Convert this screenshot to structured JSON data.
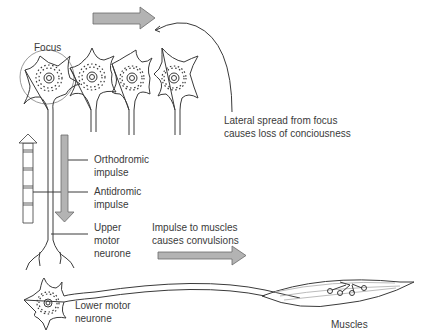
{
  "diagram": {
    "type": "neuro-physiology illustration",
    "labels": {
      "focus": "Focus",
      "lateral_spread_line1": "Lateral spread from focus",
      "lateral_spread_line2": "causes loss of conciousness",
      "orthodromic_line1": "Orthodromic",
      "orthodromic_line2": "impulse",
      "antidromic_line1": "Antidromic",
      "antidromic_line2": "impulse",
      "upper_motor_line1": "Upper",
      "upper_motor_line2": "motor",
      "upper_motor_line3": "neurone",
      "impulse_muscles_line1": "Impulse to muscles",
      "impulse_muscles_line2": "causes convulsions",
      "lower_motor_line1": "Lower motor",
      "lower_motor_line2": "neurone",
      "muscles": "Muscles"
    },
    "elements": [
      "cortical neuron (focus, circled)",
      "cortical neuron 2",
      "cortical neuron 3",
      "cortical neuron 4",
      "lateral spread arrow (grey, pointing right)",
      "curved callout line",
      "orthodromic arrow (grey, pointing down)",
      "antidromic arrow (outline, pointing up)",
      "upper motor neurone axon",
      "lower motor neurone",
      "impulse arrow (grey, pointing right)",
      "muscle with motor end plates"
    ],
    "colors": {
      "line": "#3a3a3a",
      "arrow_fill": "#b3b3b3",
      "arrow_stroke": "#6a6a6a",
      "focus_circle": "#9a9a9a",
      "text": "#3a3a3a"
    }
  }
}
